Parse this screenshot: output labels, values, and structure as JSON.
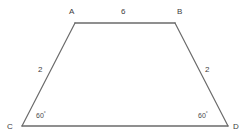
{
  "figure": {
    "type": "geometry-diagram",
    "shape": "isosceles-trapezoid",
    "background_color": "#ffffff",
    "stroke_color": "#6b6b6b",
    "text_color": "#3d3d3d",
    "vertices": [
      {
        "name": "A",
        "label": "A",
        "x": 75,
        "y": 23
      },
      {
        "name": "B",
        "label": "B",
        "x": 175,
        "y": 23
      },
      {
        "name": "C",
        "label": "C",
        "x": 22,
        "y": 126
      },
      {
        "name": "D",
        "label": "D",
        "x": 228,
        "y": 126
      }
    ],
    "side_labels": [
      {
        "name": "side-ab",
        "label": "6",
        "x": 121,
        "y": 8
      },
      {
        "name": "side-ac",
        "label": "2",
        "x": 38,
        "y": 66
      },
      {
        "name": "side-bd",
        "label": "2",
        "x": 205,
        "y": 66
      }
    ],
    "angle_labels": [
      {
        "name": "angle-c",
        "value": "60",
        "degree": "°",
        "x": 36,
        "y": 112
      },
      {
        "name": "angle-d",
        "value": "60",
        "degree": "°",
        "x": 198,
        "y": 112
      }
    ]
  }
}
